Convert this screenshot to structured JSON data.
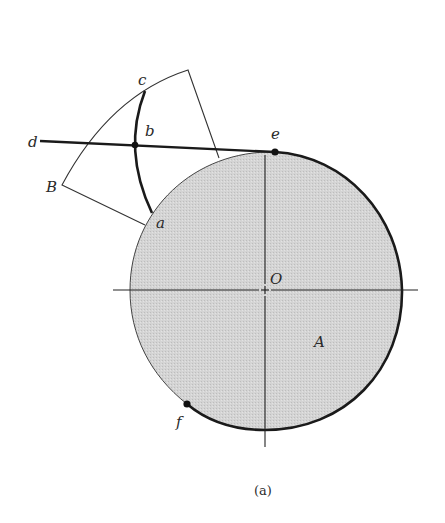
{
  "figure": {
    "caption": "(a)",
    "colors": {
      "cam_fill": "#d6d6d6",
      "stroke": "#1a1a1a",
      "thin_stroke": "#333333",
      "background": "#ffffff"
    },
    "labels": {
      "c": "c",
      "b": "b",
      "d": "d",
      "B": "B",
      "a": "a",
      "e": "e",
      "O": "O",
      "A": "A",
      "f": "f"
    }
  }
}
